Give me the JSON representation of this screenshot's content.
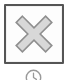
{
  "canvas": {
    "width": 68,
    "height": 80,
    "background_color": "#ffffff"
  },
  "close_button": {
    "name": "close-button",
    "tooltip": "Close",
    "frame_color": "#555555",
    "fill_color": "#ffffff",
    "x": 4,
    "y": 4,
    "width": 60,
    "height": 60,
    "border_width": 2
  },
  "close_icon": {
    "name": "close-x-icon",
    "glyph": "x-mark",
    "fill_color": "#d8d8d8",
    "stroke_color": "#8f8f8f",
    "stroke_width": 1.6
  },
  "history_icon": {
    "name": "history-clock-icon",
    "glyph": "clock",
    "stroke_color": "#9a9a9a",
    "stroke_width": 1.4,
    "cropped": "bottom"
  }
}
